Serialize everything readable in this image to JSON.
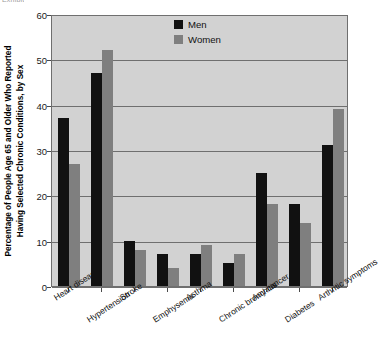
{
  "top_partial_text": "Exhibit",
  "axis": {
    "y_title_line1": "Percentage of People Age 65 and Older Who Reported",
    "y_title_line2": "Having Selected Chronic Conditions, by Sex",
    "y_ticks": [
      "0",
      "10",
      "20",
      "30",
      "40",
      "50",
      "60"
    ]
  },
  "legend": {
    "position": "inside-top-center",
    "entries": [
      {
        "label": "Men",
        "color": "#111111"
      },
      {
        "label": "Women",
        "color": "#7f7f7f"
      }
    ]
  },
  "chart_data": {
    "type": "bar",
    "title": "",
    "subtitle": "",
    "xlabel": "",
    "ylabel": "Percentage of People Age 65 and Older Who Reported Having Selected Chronic Conditions, by Sex",
    "ylim": [
      0,
      60
    ],
    "ytick_values": [
      0,
      10,
      20,
      30,
      40,
      50,
      60
    ],
    "grid": true,
    "grid_axis": "y",
    "legend_position": "inside-top-center",
    "categories": [
      "Heart disease",
      "Hypertension",
      "Stroke",
      "Emphysema",
      "Asthma",
      "Chronic bronchitis",
      "Any cancer",
      "Diabetes",
      "Arthritic symptoms"
    ],
    "series": [
      {
        "name": "Men",
        "color": "#111111",
        "values": [
          37,
          47,
          10,
          7,
          7,
          5,
          25,
          18,
          31
        ]
      },
      {
        "name": "Women",
        "color": "#7f7f7f",
        "values": [
          27,
          52,
          8,
          4,
          9,
          7,
          18,
          14,
          39
        ]
      }
    ]
  },
  "colors": {
    "plot_background": "#d2d2d2",
    "page_background": "#ffffff",
    "gridline": "#6f6f6f",
    "men": "#111111",
    "women": "#7f7f7f"
  }
}
